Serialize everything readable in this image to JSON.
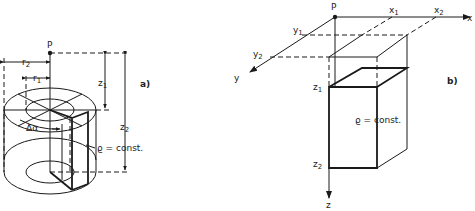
{
  "figure_a": {
    "panel_label": "a)",
    "point_label": "P",
    "r_outer_label": "r",
    "r_outer_sub": "2",
    "r_inner_label": "r",
    "r_inner_sub": "1",
    "z1_label": "z",
    "z1_sub": "1",
    "z2_label": "z",
    "z2_sub": "2",
    "angle_label": "Δα",
    "density_label": "ϱ = const."
  },
  "figure_b": {
    "panel_label": "b)",
    "point_label": "P",
    "x_axis_label": "x",
    "x1_label": "x",
    "x1_sub": "1",
    "x2_label": "x",
    "x2_sub": "2",
    "y_axis_label": "y",
    "y1_label": "y",
    "y1_sub": "1",
    "y2_label": "y",
    "y2_sub": "2",
    "z_axis_label": "z",
    "z1_label": "z",
    "z1_sub": "1",
    "z2_label": "z",
    "z2_sub": "2",
    "density_label": "ϱ = const."
  }
}
